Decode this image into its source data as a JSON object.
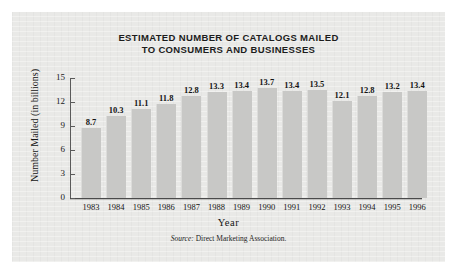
{
  "chart_data": {
    "type": "bar",
    "title": "ESTIMATED NUMBER OF CATALOGS MAILED TO CONSUMERS AND BUSINESSES",
    "title_line1": "ESTIMATED NUMBER OF CATALOGS MAILED",
    "title_line2": "TO CONSUMERS AND BUSINESSES",
    "xlabel": "Year",
    "ylabel": "Number Mailed (in billions)",
    "categories": [
      "1983",
      "1984",
      "1985",
      "1986",
      "1987",
      "1988",
      "1989",
      "1990",
      "1991",
      "1992",
      "1993",
      "1994",
      "1995",
      "1996"
    ],
    "values": [
      8.7,
      10.3,
      11.1,
      11.8,
      12.8,
      13.3,
      13.4,
      13.7,
      13.4,
      13.5,
      12.1,
      12.8,
      13.2,
      13.4
    ],
    "value_labels": [
      "8.7",
      "10.3",
      "11.1",
      "11.8",
      "12.8",
      "13.3",
      "13.4",
      "13.7",
      "13.4",
      "13.5",
      "12.1",
      "12.8",
      "13.2",
      "13.4"
    ],
    "ylim": [
      0,
      15
    ],
    "yticks": [
      0,
      3,
      6,
      9,
      12,
      15
    ],
    "ytick_labels": [
      "0",
      "3",
      "6",
      "9",
      "12",
      "15"
    ],
    "grid": false,
    "legend": false,
    "bar_color": "#c8c8c6",
    "panel_color": "#e9e9e7",
    "axis_color": "#4a4a4a",
    "text_color": "#141414"
  },
  "source": {
    "prefix": "Source:",
    "text": "Direct Marketing Association."
  }
}
